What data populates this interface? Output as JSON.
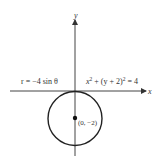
{
  "diagram": {
    "axes": {
      "x_label": "x",
      "y_label": "y"
    },
    "polar_equation": "r = −4 sin θ",
    "cartesian_equation": {
      "base": "x",
      "exp1": "2",
      "mid": " + (y + 2)",
      "exp2": "2",
      "rhs": " = 4"
    },
    "center_label": "(0, −2)",
    "colors": {
      "stroke": "#222222",
      "text": "#333333"
    }
  }
}
